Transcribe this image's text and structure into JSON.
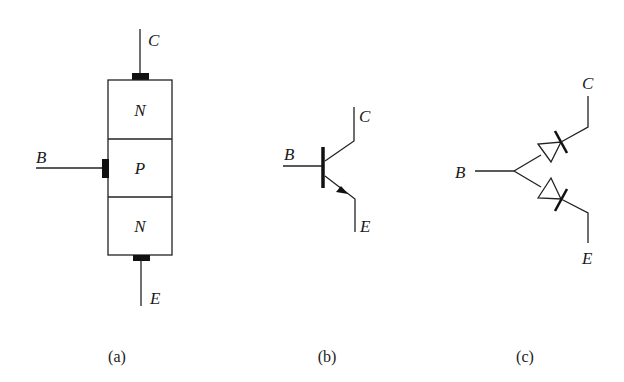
{
  "figure": {
    "colors": {
      "line": "#222222",
      "contact": "#111111",
      "background": "#ffffff"
    },
    "panels": [
      {
        "id": "a",
        "caption": "(a)",
        "title": "layer structure",
        "layers": [
          "N",
          "P",
          "N"
        ],
        "terminals": {
          "collector": "C",
          "base": "B",
          "emitter": "E"
        }
      },
      {
        "id": "b",
        "caption": "(b)",
        "title": "circuit symbol",
        "terminals": {
          "collector": "C",
          "base": "B",
          "emitter": "E"
        }
      },
      {
        "id": "c",
        "caption": "(c)",
        "title": "diode equivalent",
        "terminals": {
          "collector": "C",
          "base": "B",
          "emitter": "E"
        }
      }
    ]
  }
}
